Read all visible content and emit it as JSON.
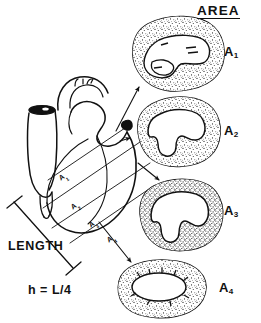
{
  "figure": {
    "kind": "anatomical-diagram",
    "title": "AREA",
    "background_color": "#ffffff",
    "ink_color": "#111111"
  },
  "header": {
    "title": "AREA"
  },
  "measurements": {
    "length_label": "LENGTH",
    "slice_thickness_formula": "h = L/4",
    "formula_parts": {
      "variable": "h",
      "equals": "=",
      "expression": "L/4"
    },
    "divisions": 4
  },
  "section_planes": [
    {
      "id": "A1",
      "label": "A",
      "subscript": "1"
    },
    {
      "id": "A2",
      "label": "A",
      "subscript": "2"
    },
    {
      "id": "A3",
      "label": "A",
      "subscript": "3"
    },
    {
      "id": "A4",
      "label": "A",
      "subscript": "4"
    }
  ],
  "cross_sections": [
    {
      "id": "A1",
      "label": "A",
      "subscript": "1",
      "description": "basal transverse section, broad slit-like cavity",
      "cavity_shape": "elongated-irregular"
    },
    {
      "id": "A2",
      "label": "A",
      "subscript": "2",
      "description": "upper-mid section, two ventricular chambers",
      "cavity_shape": "bilobed"
    },
    {
      "id": "A3",
      "label": "A",
      "subscript": "3",
      "description": "lower-mid section, rounded bilobed cavity",
      "cavity_shape": "bilobed-rounded"
    },
    {
      "id": "A4",
      "label": "A",
      "subscript": "4",
      "description": "apical section, small oval cavity, thick wall",
      "cavity_shape": "oval-small"
    }
  ],
  "anatomy": {
    "great_vessel_label": "",
    "wall_texture": "stippled",
    "cavity_fill": "#ffffff"
  }
}
